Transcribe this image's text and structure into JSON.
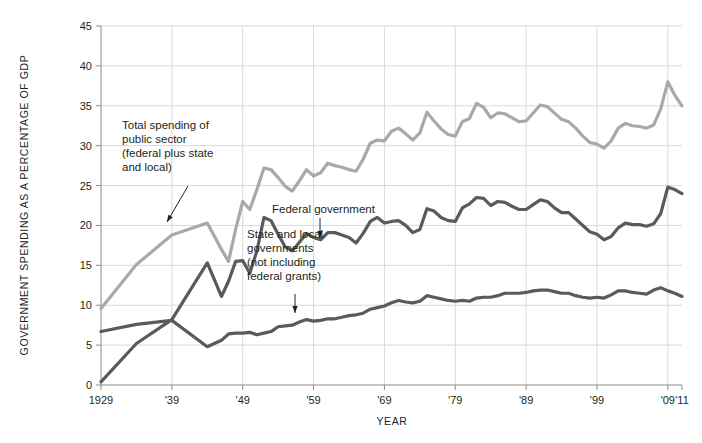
{
  "chart_data": {
    "type": "line",
    "title": "",
    "xlabel": "YEAR",
    "ylabel": "GOVERNMENT SPENDING AS A PERCENTAGE OF GDP",
    "xlim": [
      1929,
      2011
    ],
    "ylim": [
      0,
      45
    ],
    "ytick_values": [
      0,
      5,
      10,
      15,
      20,
      25,
      30,
      35,
      40,
      45
    ],
    "ytick_labels": [
      "0",
      "5",
      "10",
      "15",
      "20",
      "25",
      "30",
      "35",
      "40",
      "45"
    ],
    "xtick_values": [
      1929,
      1939,
      1949,
      1959,
      1969,
      1979,
      1989,
      1999,
      2009,
      2011
    ],
    "xtick_labels": [
      "1929",
      "'39",
      "'49",
      "'59",
      "'69",
      "'79",
      "'89",
      "'99",
      "'09",
      "'11"
    ],
    "grid": true,
    "legend_position": "inline-annotations",
    "series": [
      {
        "name": "Total spending of public sector (federal plus state and local)",
        "color": "#a9a9a9",
        "x": [
          1929,
          1934,
          1939,
          1944,
          1946,
          1947,
          1948,
          1949,
          1950,
          1951,
          1952,
          1953,
          1954,
          1955,
          1956,
          1957,
          1958,
          1959,
          1960,
          1961,
          1962,
          1963,
          1964,
          1965,
          1966,
          1967,
          1968,
          1969,
          1970,
          1971,
          1972,
          1973,
          1974,
          1975,
          1976,
          1977,
          1978,
          1979,
          1980,
          1981,
          1982,
          1983,
          1984,
          1985,
          1986,
          1987,
          1988,
          1989,
          1990,
          1991,
          1992,
          1993,
          1994,
          1995,
          1996,
          1997,
          1998,
          1999,
          2000,
          2001,
          2002,
          2003,
          2004,
          2005,
          2006,
          2007,
          2008,
          2009,
          2010,
          2011
        ],
        "values": [
          9.6,
          15.1,
          18.8,
          20.3,
          17.0,
          15.5,
          19.5,
          23.0,
          22.0,
          24.5,
          27.2,
          27.0,
          26.0,
          24.9,
          24.3,
          25.6,
          27.0,
          26.2,
          26.6,
          27.8,
          27.5,
          27.3,
          27.0,
          26.8,
          28.3,
          30.3,
          30.7,
          30.6,
          31.8,
          32.2,
          31.5,
          30.7,
          31.6,
          34.2,
          33.1,
          32.1,
          31.4,
          31.2,
          33.0,
          33.4,
          35.3,
          34.8,
          33.5,
          34.1,
          34.0,
          33.5,
          33.0,
          33.1,
          34.1,
          35.1,
          34.9,
          34.1,
          33.3,
          33.0,
          32.2,
          31.2,
          30.4,
          30.2,
          29.7,
          30.6,
          32.2,
          32.8,
          32.5,
          32.4,
          32.2,
          32.6,
          34.6,
          38.0,
          36.3,
          35.0
        ]
      },
      {
        "name": "Federal government",
        "color": "#5a5a5a",
        "x": [
          1929,
          1934,
          1939,
          1944,
          1946,
          1947,
          1948,
          1949,
          1950,
          1951,
          1952,
          1953,
          1954,
          1955,
          1956,
          1957,
          1958,
          1959,
          1960,
          1961,
          1962,
          1963,
          1964,
          1965,
          1966,
          1967,
          1968,
          1969,
          1970,
          1971,
          1972,
          1973,
          1974,
          1975,
          1976,
          1977,
          1978,
          1979,
          1980,
          1981,
          1982,
          1983,
          1984,
          1985,
          1986,
          1987,
          1988,
          1989,
          1990,
          1991,
          1992,
          1993,
          1994,
          1995,
          1996,
          1997,
          1998,
          1999,
          2000,
          2001,
          2002,
          2003,
          2004,
          2005,
          2006,
          2007,
          2008,
          2009,
          2010,
          2011
        ],
        "values": [
          0.4,
          5.2,
          8.2,
          15.3,
          11.1,
          13.0,
          15.5,
          15.6,
          14.0,
          16.8,
          21.0,
          20.6,
          18.9,
          17.3,
          16.8,
          17.9,
          19.0,
          18.5,
          18.2,
          19.1,
          19.1,
          18.8,
          18.5,
          17.8,
          19.0,
          20.5,
          21.0,
          20.3,
          20.5,
          20.6,
          20.0,
          19.1,
          19.5,
          22.1,
          21.8,
          21.0,
          20.6,
          20.5,
          22.2,
          22.7,
          23.5,
          23.4,
          22.5,
          23.0,
          22.9,
          22.4,
          22.0,
          22.0,
          22.6,
          23.2,
          23.0,
          22.2,
          21.6,
          21.6,
          20.8,
          20.0,
          19.2,
          18.9,
          18.2,
          18.6,
          19.7,
          20.3,
          20.1,
          20.1,
          19.9,
          20.2,
          21.5,
          24.8,
          24.5,
          24.0
        ]
      },
      {
        "name": "State and local governments (not including federal grants)",
        "color": "#5a5a5a",
        "x": [
          1929,
          1934,
          1939,
          1944,
          1946,
          1947,
          1948,
          1949,
          1950,
          1951,
          1952,
          1953,
          1954,
          1955,
          1956,
          1957,
          1958,
          1959,
          1960,
          1961,
          1962,
          1963,
          1964,
          1965,
          1966,
          1967,
          1968,
          1969,
          1970,
          1971,
          1972,
          1973,
          1974,
          1975,
          1976,
          1977,
          1978,
          1979,
          1980,
          1981,
          1982,
          1983,
          1984,
          1985,
          1986,
          1987,
          1988,
          1989,
          1990,
          1991,
          1992,
          1993,
          1994,
          1995,
          1996,
          1997,
          1998,
          1999,
          2000,
          2001,
          2002,
          2003,
          2004,
          2005,
          2006,
          2007,
          2008,
          2009,
          2010,
          2011
        ],
        "values": [
          6.7,
          7.6,
          8.1,
          4.8,
          5.6,
          6.4,
          6.5,
          6.5,
          6.6,
          6.3,
          6.5,
          6.7,
          7.3,
          7.4,
          7.5,
          7.9,
          8.2,
          8.0,
          8.1,
          8.3,
          8.3,
          8.5,
          8.7,
          8.8,
          9.0,
          9.5,
          9.7,
          9.9,
          10.3,
          10.6,
          10.4,
          10.3,
          10.5,
          11.2,
          11.0,
          10.8,
          10.6,
          10.5,
          10.6,
          10.5,
          10.9,
          11.0,
          11.0,
          11.2,
          11.5,
          11.5,
          11.5,
          11.6,
          11.8,
          11.9,
          11.9,
          11.7,
          11.5,
          11.5,
          11.2,
          11.0,
          10.9,
          11.0,
          10.9,
          11.3,
          11.8,
          11.8,
          11.6,
          11.5,
          11.4,
          11.9,
          12.2,
          11.8,
          11.5,
          11.1
        ]
      }
    ],
    "annotations": [
      {
        "id": "total-spending",
        "lines": [
          "Total spending of",
          "public sector",
          "(federal plus state",
          "and local)"
        ],
        "text_x": 122,
        "text_y": 129,
        "arrow": {
          "x1": 188,
          "y1": 186,
          "x2": 167,
          "y2": 222
        }
      },
      {
        "id": "federal-government",
        "lines": [
          "Federal government"
        ],
        "text_x": 272,
        "text_y": 213,
        "arrow": {
          "x1": 320,
          "y1": 218,
          "x2": 320,
          "y2": 238
        }
      },
      {
        "id": "state-local-governments",
        "lines": [
          "State and local",
          "governments",
          "(not including",
          "federal grants)"
        ],
        "text_x": 247,
        "text_y": 238,
        "arrow": {
          "x1": 295,
          "y1": 294,
          "x2": 295,
          "y2": 313
        }
      }
    ]
  },
  "style": {
    "grid_color": "#d9d9d9",
    "axis_color": "#8c8c8c",
    "text_color": "#231f20",
    "background": "#ffffff",
    "line_width": 3.2
  },
  "plot_geometry": {
    "left": 101,
    "right": 682,
    "top": 26,
    "bottom": 385
  }
}
